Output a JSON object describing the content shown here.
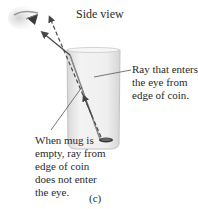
{
  "figure": {
    "title": "Side view",
    "panel_label": "(c)",
    "labels": {
      "ray_enters": [
        "Ray that enters",
        "the eye from",
        "edge of coin."
      ],
      "empty_mug": [
        "When mug is",
        "empty, ray from",
        "edge of coin",
        "does not enter",
        "the eye."
      ]
    },
    "elements": [
      "eye",
      "mug",
      "coin",
      "refracted-ray",
      "straight-ray"
    ],
    "colors": {
      "mug_fill": "#e9e9e9",
      "mug_edge": "#bdbdbd",
      "ray": "#555555",
      "text": "#2a2a2a"
    }
  }
}
